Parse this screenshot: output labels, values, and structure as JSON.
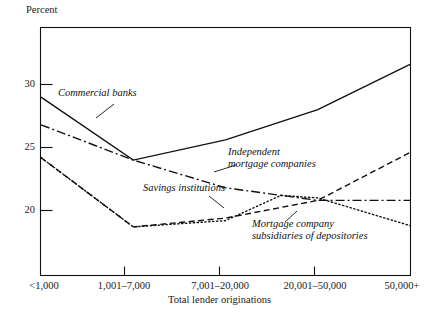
{
  "chart_data": {
    "type": "line",
    "title": "",
    "ylabel": "Percent",
    "xlabel": "Total lender originations",
    "categories": [
      "<1,000",
      "1,001–7,000",
      "7,001–20,000",
      "20,001–50,000",
      "50,000+"
    ],
    "ylim": [
      16.0,
      33.5
    ],
    "yticks": [
      20,
      25,
      30
    ],
    "ytick_labels": [
      "20",
      "25",
      "30"
    ],
    "grid": false,
    "legend": "inline-annotations",
    "series": [
      {
        "name": "Commercial banks",
        "style": "solid",
        "values": [
          29.0,
          24.0,
          25.6,
          28.0,
          31.6
        ]
      },
      {
        "name": "Independent mortgage companies",
        "style": "dash-dot",
        "values": [
          26.8,
          24.0,
          21.8,
          20.8,
          20.8
        ]
      },
      {
        "name": "Savings institutions",
        "style": "dashed",
        "values": [
          24.2,
          18.7,
          19.4,
          20.8,
          24.6
        ]
      },
      {
        "name": "Mortgage company subsidiaries of depositories",
        "style": "dotted",
        "values": [
          24.2,
          18.7,
          19.2,
          21.0,
          18.8
        ]
      }
    ],
    "annotations": [
      {
        "text": "Commercial banks",
        "x": 62,
        "y": 92
      },
      {
        "text": "Independent mortgage companies",
        "line1": "Independent",
        "line2": "mortgage companies",
        "x": 235,
        "y": 152
      },
      {
        "text": "Savings institutions",
        "x": 148,
        "y": 188
      },
      {
        "text": "Mortgage company subsidiaries of depositories",
        "line1": "Mortgage company",
        "line2": "subsidiaries of depositories",
        "x": 262,
        "y": 224
      }
    ],
    "colors": {
      "ink": "#111111",
      "axis": "#111111",
      "background": "#ffffff"
    }
  }
}
